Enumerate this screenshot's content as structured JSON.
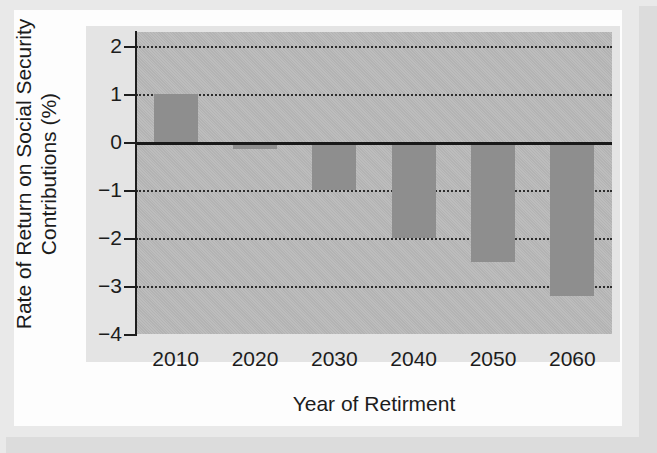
{
  "chart_data": {
    "type": "bar",
    "title": "",
    "xlabel": "Year of Retirment",
    "ylabel_lines": [
      "Rate of Return on Social Security",
      "Contributions (%)"
    ],
    "categories": [
      "2010",
      "2020",
      "2030",
      "2040",
      "2050",
      "2060"
    ],
    "values": [
      1.0,
      -0.15,
      -1.0,
      -2.0,
      -2.5,
      -3.2
    ],
    "ylim": [
      -4,
      2.3
    ],
    "yticks": [
      2,
      1,
      0,
      -1,
      -2,
      -3,
      -4
    ],
    "ytick_labels": [
      "2",
      "1",
      "0",
      "−1",
      "−2",
      "−3",
      "−4"
    ],
    "grid": "horizontal-dotted",
    "legend": "none",
    "zero_baseline": 0,
    "bar_color": "#8e8e8e",
    "plot_background": "#b9b9b9",
    "axis_color": "#1d1d1d",
    "gridline_color": "#2d2d2d"
  },
  "axes": {
    "y_title_line1": "Rate of Return on Social Security",
    "y_title_line2": "Contributions (%)",
    "x_title": "Year of Retirment"
  },
  "ticks": {
    "y": [
      {
        "label": "2",
        "value": 2
      },
      {
        "label": "1",
        "value": 1
      },
      {
        "label": "0",
        "value": 0
      },
      {
        "label": "−1",
        "value": -1
      },
      {
        "label": "−2",
        "value": -2
      },
      {
        "label": "−3",
        "value": -3
      },
      {
        "label": "−4",
        "value": -4
      }
    ],
    "x": [
      {
        "label": "2010",
        "value": -1.0
      },
      {
        "label": "2020",
        "value": -0.15
      },
      {
        "label": "2030",
        "value": -1.0
      },
      {
        "label": "2040",
        "value": -2.0
      },
      {
        "label": "2050",
        "value": -2.5
      },
      {
        "label": "2060",
        "value": -3.2
      }
    ]
  },
  "bars": [
    {
      "category": "2010",
      "value": 1.0
    },
    {
      "category": "2020",
      "value": -0.15
    },
    {
      "category": "2030",
      "value": -1.0
    },
    {
      "category": "2040",
      "value": -2.0
    },
    {
      "category": "2050",
      "value": -2.5
    },
    {
      "category": "2060",
      "value": -3.2
    }
  ]
}
